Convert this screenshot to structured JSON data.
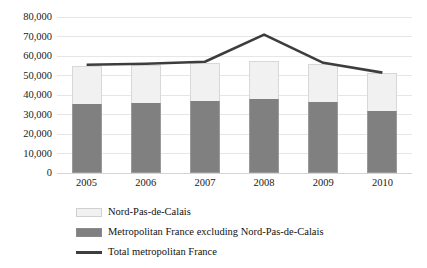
{
  "chart_data": {
    "type": "bar",
    "title": "",
    "subtitle": "",
    "xlabel": "",
    "ylabel": "",
    "categories": [
      "2005",
      "2006",
      "2007",
      "2008",
      "2009",
      "2010"
    ],
    "ylim": [
      0,
      80000
    ],
    "yticks": [
      0,
      10000,
      20000,
      30000,
      40000,
      50000,
      60000,
      70000,
      80000
    ],
    "ytick_labels": [
      "0",
      "10,000",
      "20,000",
      "30,000",
      "40,000",
      "50,000",
      "60,000",
      "70,000",
      "80,000"
    ],
    "grid": true,
    "stacked": true,
    "legend_position": "bottom-left",
    "series": [
      {
        "name": "Metropolitan France excluding Nord-Pas-de-Calais",
        "type": "bar",
        "color": "#808080",
        "values": [
          35500,
          36000,
          36800,
          37800,
          36500,
          32000
        ]
      },
      {
        "name": "Nord-Pas-de-Calais",
        "type": "bar",
        "color": "#f1f1f1",
        "values": [
          19500,
          19500,
          19700,
          19700,
          19500,
          19500
        ]
      },
      {
        "name": "Total metropolitan France",
        "type": "line",
        "color": "#3d3d3d",
        "values": [
          55500,
          56000,
          57000,
          71000,
          56500,
          51500
        ]
      }
    ]
  },
  "legend": {
    "items": [
      {
        "label": "Nord-Pas-de-Calais",
        "swatch": "light"
      },
      {
        "label": "Metropolitan France excluding Nord-Pas-de-Calais",
        "swatch": "dark"
      },
      {
        "label": "Total metropolitan France",
        "swatch": "line"
      }
    ]
  }
}
